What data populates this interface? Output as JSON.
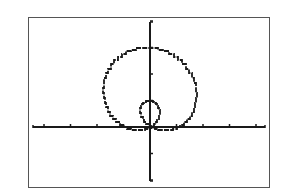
{
  "screen": {
    "description": "Graphing calculator window showing a polar limaçon with inner loop",
    "frame_color": "#555555",
    "ink_color": "#1a1a1a",
    "background": "#ffffff"
  },
  "chart_data": {
    "type": "line",
    "title": "",
    "xlabel": "",
    "ylabel": "",
    "equation_shape": "limaçon with inner loop, r = 1 + 2 sin(θ)",
    "xlim": [
      -4.5,
      4.5
    ],
    "ylim": [
      -2,
      4
    ],
    "grid": false,
    "legend": null,
    "x_ticks": [
      -4,
      -3,
      -2,
      -1,
      1,
      2,
      3,
      4
    ],
    "y_ticks": [
      -2,
      -1,
      1,
      2,
      3,
      4
    ],
    "tick_labels_shown": false,
    "series": [
      {
        "name": "r = 1 + 2 sin θ",
        "polar": true,
        "r_formula": "1 + 2*sin(theta)",
        "theta_range": [
          0,
          6.2832
        ]
      }
    ],
    "key_points": {
      "outer_top": [
        0,
        3
      ],
      "inner_top": [
        0,
        1
      ],
      "origin_crossings": [
        [
          0,
          0
        ]
      ],
      "outer_left_extent": [
        -2.6,
        1.6
      ],
      "outer_right_extent": [
        2.6,
        1.6
      ]
    }
  },
  "layout": {
    "origin_px": [
      150,
      127
    ],
    "unit_px_x": 26.5,
    "unit_px_y": 26.5,
    "x_axis_px": [
      33,
      265
    ],
    "y_axis_px": [
      22,
      181
    ]
  }
}
